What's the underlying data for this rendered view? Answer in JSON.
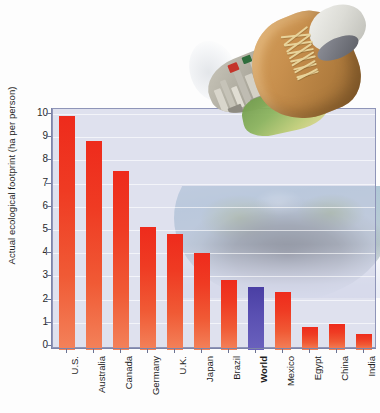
{
  "chart_data": {
    "type": "bar",
    "title": "",
    "xlabel": "",
    "ylabel": "Actual ecological footprint (ha per person)",
    "ylim": [
      0,
      10.4
    ],
    "yticks": [
      0,
      1,
      2,
      3,
      4,
      5,
      6,
      7,
      8,
      9,
      10
    ],
    "grid": true,
    "legend": "none",
    "highlight_category": "World",
    "colors": {
      "bar": "#ee2b1c",
      "bar_bottom": "#f3825a",
      "highlight_bar": "#5a50b2",
      "plot_background": "#c7cbe2",
      "plot_border": "#8f95b8",
      "gridline": "#ffffff",
      "text": "#1d1d1d"
    },
    "categories": [
      "U.S.",
      "Australia",
      "Canada",
      "Germany",
      "U.K.",
      "Japan",
      "Brazil",
      "World",
      "Mexico",
      "Egypt",
      "China",
      "India"
    ],
    "values": [
      10.1,
      9.0,
      7.7,
      5.3,
      5.0,
      4.2,
      3.0,
      2.7,
      2.5,
      1.0,
      1.1,
      0.7
    ],
    "bar_colors": [
      "red",
      "red",
      "red",
      "red",
      "red",
      "red",
      "red",
      "blue",
      "red",
      "red",
      "red",
      "red"
    ],
    "bold_labels": [
      "World"
    ]
  },
  "decorations": {
    "boot_image": "hiking-boot-with-industrial-city-sole-photo",
    "globe_image": "earth-globe-with-dark-footprint-shadow-photo"
  }
}
